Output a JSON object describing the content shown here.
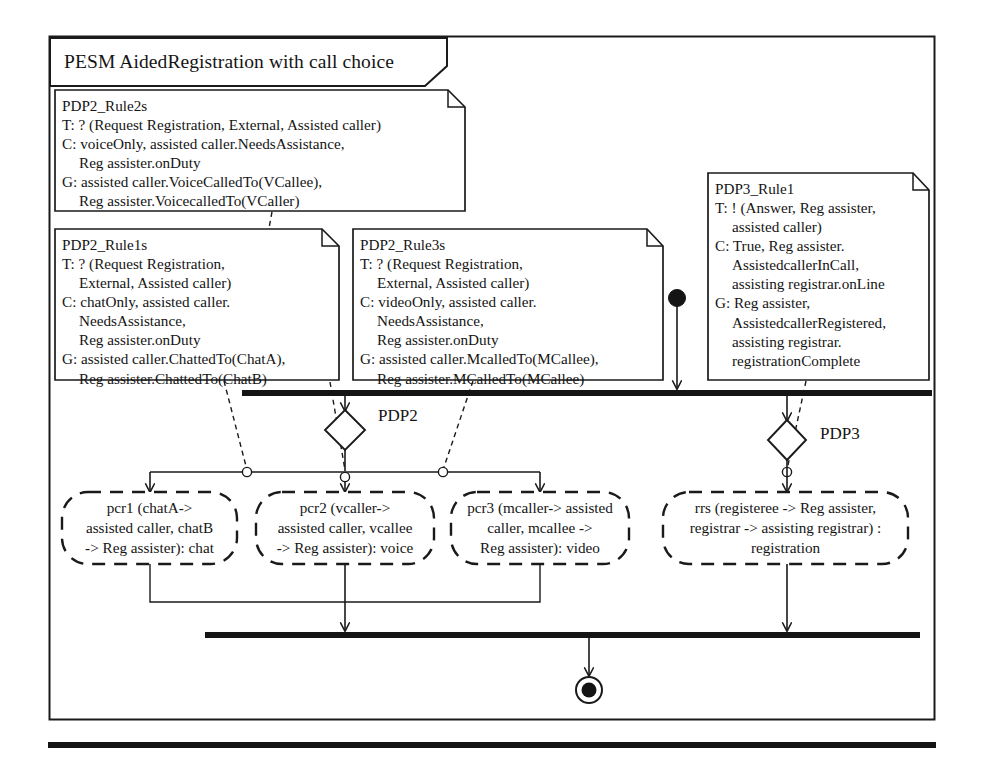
{
  "diagram": {
    "kind": "uml-activity-diagram",
    "frame_title": "PESM AidedRegistration with call choice",
    "colors": {
      "stroke": "#1a1a1a",
      "fill": "#ffffff",
      "bar": "#141414",
      "text": "#141414"
    }
  },
  "notes": [
    {
      "id": "pdp2-rule2s",
      "title": "PDP2_Rule2s",
      "lines": [
        "PDP2_Rule2s",
        "T: ? (Request Registration, External, Assisted caller)",
        "C: voiceOnly, assisted caller.NeedsAssistance,",
        "Reg assister.onDuty",
        "G: assisted caller.VoiceCalledTo(VCallee),",
        "Reg assister.VoicecalledTo(VCaller)"
      ],
      "indent": [
        0,
        0,
        0,
        1,
        0,
        1
      ]
    },
    {
      "id": "pdp2-rule1s",
      "title": "PDP2_Rule1s",
      "lines": [
        "PDP2_Rule1s",
        "T: ? (Request Registration,",
        "External, Assisted caller)",
        "C: chatOnly, assisted caller.",
        "NeedsAssistance,",
        "Reg assister.onDuty",
        "G: assisted caller.ChattedTo(ChatA),",
        "Reg assister.ChattedTo(ChatB)"
      ],
      "indent": [
        0,
        0,
        1,
        0,
        1,
        1,
        0,
        1
      ]
    },
    {
      "id": "pdp2-rule3s",
      "title": "PDP2_Rule3s",
      "lines": [
        "PDP2_Rule3s",
        "T: ? (Request Registration,",
        "External, Assisted caller)",
        "C: videoOnly, assisted caller.",
        "NeedsAssistance,",
        "Reg assister.onDuty",
        "G: assisted caller.McalledTo(MCallee),",
        "Reg assister.MCalledTo(MCallee)"
      ],
      "indent": [
        0,
        0,
        1,
        0,
        1,
        1,
        0,
        1
      ]
    },
    {
      "id": "pdp3-rule1",
      "title": "PDP3_Rule1",
      "lines": [
        "PDP3_Rule1",
        "T: ! (Answer, Reg assister,",
        "assisted caller)",
        "C: True, Reg assister.",
        "AssistedcallerInCall,",
        "assisting registrar.onLine",
        "G: Reg assister,",
        "AssistedcallerRegistered,",
        "assisting registrar.",
        "registrationComplete"
      ],
      "indent": [
        0,
        0,
        1,
        0,
        1,
        1,
        0,
        1,
        1,
        1
      ]
    }
  ],
  "actions": [
    {
      "id": "pcr1",
      "lines": [
        "pcr1 (chatA->",
        "assisted caller, chatB",
        "-> Reg assister): chat"
      ]
    },
    {
      "id": "pcr2",
      "lines": [
        "pcr2 (vcaller->",
        "assisted caller, vcallee",
        "-> Reg assister): voice"
      ]
    },
    {
      "id": "pcr3",
      "lines": [
        "pcr3 (mcaller-> assisted",
        "caller, mcallee ->",
        "Reg assister): video"
      ]
    },
    {
      "id": "rrs",
      "lines": [
        "rrs (registeree -> Reg assister,",
        "registrar -> assisting registrar) :",
        "registration"
      ]
    }
  ],
  "decisions": [
    {
      "id": "pdp2",
      "label": "PDP2"
    },
    {
      "id": "pdp3",
      "label": "PDP3"
    }
  ],
  "nodes": {
    "initial_node": "initial-node",
    "final_node": "activity-final-node",
    "fork_bar": "fork-bar",
    "join_bar": "join-bar"
  }
}
